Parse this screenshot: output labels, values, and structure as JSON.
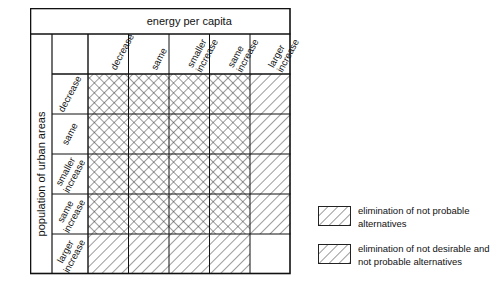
{
  "matrix": {
    "column_axis_title": "energy per capita",
    "row_axis_title": "population of urban areas",
    "column_headers": [
      "decrease",
      "same",
      "smaller increase",
      "same increase",
      "larger increase"
    ],
    "row_headers": [
      "decrease",
      "same",
      "smaller increase",
      "same increase",
      "larger increase"
    ],
    "fills": [
      [
        "both",
        "both",
        "both",
        "both",
        "single"
      ],
      [
        "both",
        "both",
        "both",
        "both",
        "single"
      ],
      [
        "both",
        "both",
        "both",
        "both",
        "single"
      ],
      [
        "both",
        "both",
        "both",
        "both",
        "single"
      ],
      [
        "single",
        "single",
        "single",
        "single",
        "none"
      ]
    ]
  },
  "legend": {
    "items": [
      {
        "pattern": "single",
        "label": "elimination of not probable alternatives"
      },
      {
        "pattern": "both",
        "label": "elimination of not desirable and not probable alternatives"
      }
    ]
  }
}
